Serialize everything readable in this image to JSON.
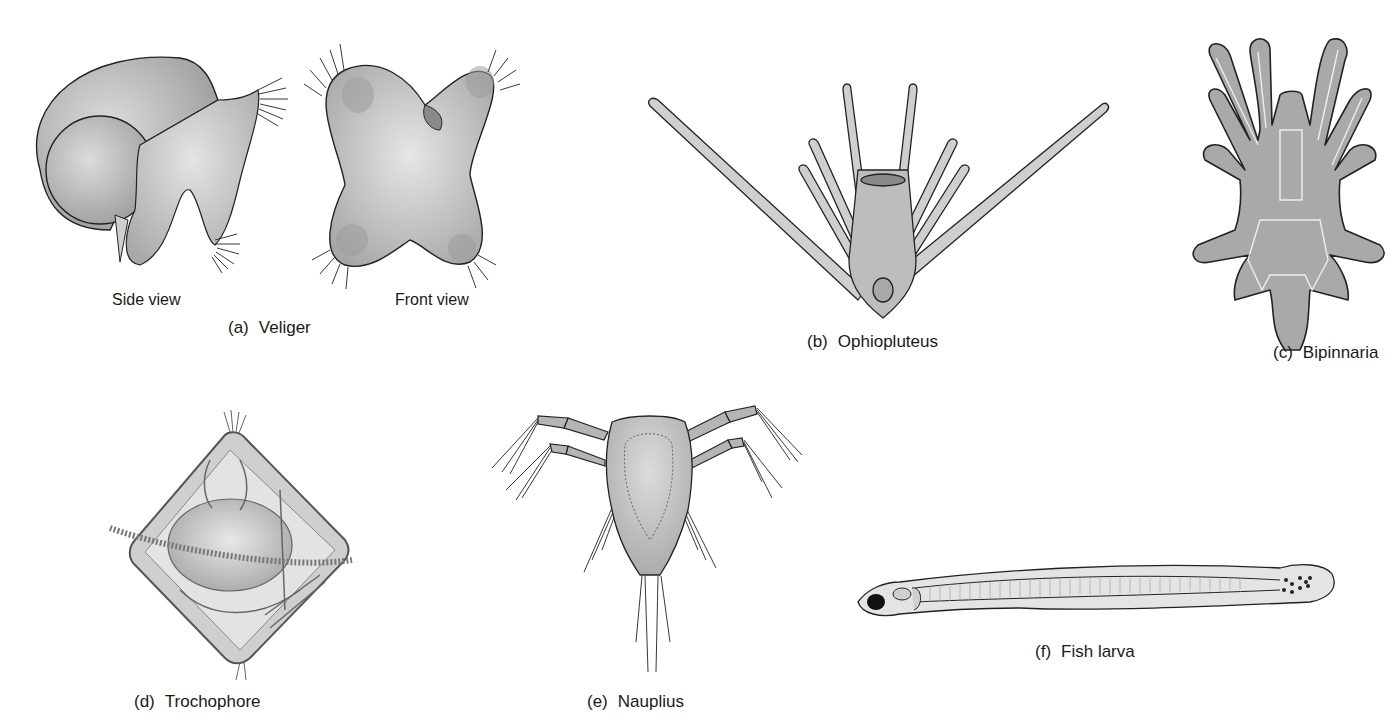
{
  "figure": {
    "panels": [
      {
        "id": "a",
        "letter": "(a)",
        "name": "Veliger",
        "sub_views": [
          "Side view",
          "Front view"
        ]
      },
      {
        "id": "b",
        "letter": "(b)",
        "name": "Ophiopluteus"
      },
      {
        "id": "c",
        "letter": "(c)",
        "name": "Bipinnaria"
      },
      {
        "id": "d",
        "letter": "(d)",
        "name": "Trochophore"
      },
      {
        "id": "e",
        "letter": "(e)",
        "name": "Nauplius"
      },
      {
        "id": "f",
        "letter": "(f)",
        "name": "Fish larva"
      }
    ]
  },
  "colors": {
    "background": "#ffffff",
    "ink": "#1a1a1a",
    "body_fill": "#bdbdbd",
    "body_light": "#d9d9d9",
    "body_dark": "#8a8a8a"
  }
}
